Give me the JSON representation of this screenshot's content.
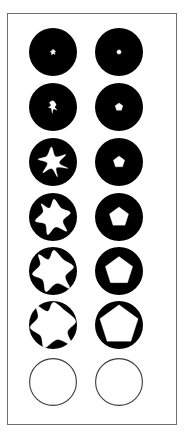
{
  "figure": {
    "title": "Shape growth series",
    "background_color": "#ffffff",
    "frame": {
      "border_color": "#6e6e72",
      "border_width_px": 1,
      "x": 7,
      "y": 13,
      "width": 170,
      "height": 412
    },
    "disk_color": "#000000",
    "inner_shape_color": "#ffffff",
    "empty_circle_stroke": "#3a3a3a",
    "rows": 7,
    "columns": 2,
    "column_labels": [
      "irregular",
      "regular"
    ],
    "circle_radius_px": 24
  },
  "chart_data": {
    "type": "diagram-grid",
    "title": "Shape growth series",
    "xlabel": "",
    "ylabel": "",
    "columns": [
      {
        "name": "irregular",
        "shape_family": "pinwheel-star"
      },
      {
        "name": "regular",
        "shape_family": "polygon"
      }
    ],
    "rows": [
      {
        "index": 1,
        "fraction": 0.04
      },
      {
        "index": 2,
        "fraction": 0.11
      },
      {
        "index": 3,
        "fraction": 0.24
      },
      {
        "index": 4,
        "fraction": 0.42
      },
      {
        "index": 5,
        "fraction": 0.62
      },
      {
        "index": 6,
        "fraction": 0.85
      },
      {
        "index": 7,
        "fraction": 1.0
      }
    ],
    "cells": [
      {
        "row": 1,
        "column": "irregular",
        "state": "disk-with-inner",
        "inner_scale": 0.11,
        "inner_points": "0,-1 0.34,-0.55 0.92,-0.28 0.52,0.2 0.78,0.82 0.1,0.56 -0.5,0.95 -0.42,0.3 -0.95,-0.12 -0.36,-0.42"
      },
      {
        "row": 1,
        "column": "regular",
        "state": "disk-with-inner",
        "inner_scale": 0.09,
        "inner_points": "0,-1 0.95,-0.31 0.59,0.81 -0.59,0.81 -0.95,-0.31"
      },
      {
        "row": 2,
        "column": "irregular",
        "state": "disk-with-inner",
        "inner_scale": 0.26,
        "inner_points": "0.02,-1 0.5,-0.38 0.28,0.02 0.62,0.5 0.06,0.35 -0.12,1 -0.3,0.22 -0.72,0.1 -0.34,-0.28 -0.55,-0.72"
      },
      {
        "row": 2,
        "column": "regular",
        "state": "disk-with-inner",
        "inner_scale": 0.17,
        "inner_points": "0,-1 0.95,-0.31 0.59,0.81 -0.59,0.81 -0.95,-0.31"
      },
      {
        "row": 3,
        "column": "irregular",
        "state": "disk-with-inner",
        "inner_scale": 0.62,
        "inner_points": "-0.1,-1 0.18,-0.36 0.86,-0.5 0.42,0.06 1,0.42 0.24,0.38 0.3,1 -0.1,0.44 -0.68,0.72 -0.38,0.08 -1,-0.18 -0.42,-0.4"
      },
      {
        "row": 3,
        "column": "regular",
        "state": "disk-with-inner",
        "inner_scale": 0.25,
        "inner_points": "0,-1 0.95,-0.31 0.59,0.81 -0.59,0.81 -0.95,-0.31"
      },
      {
        "row": 4,
        "column": "irregular",
        "state": "disk-with-inner",
        "inner_scale": 0.74,
        "inner_points": "0.06,-1 0.46,-0.5 0.98,-0.24 0.56,0.22 0.78,0.8 0.16,0.56 -0.3,1 -0.44,0.4 -1,0.22 -0.56,-0.28 -0.66,-0.74 -0.2,-0.5"
      },
      {
        "row": 4,
        "column": "regular",
        "state": "disk-with-inner",
        "inner_scale": 0.42,
        "inner_points": "0,-1 0.95,-0.31 0.59,0.81 -0.59,0.81 -0.95,-0.31"
      },
      {
        "row": 5,
        "column": "irregular",
        "state": "disk-with-inner",
        "inner_scale": 0.86,
        "inner_points": "0.04,-1 0.5,-0.56 1,-0.2 0.6,0.26 0.8,0.84 0.18,0.6 -0.34,1 -0.5,0.44 -1,0.16 -0.62,-0.3 -0.7,-0.8 -0.22,-0.56"
      },
      {
        "row": 5,
        "column": "regular",
        "state": "disk-with-inner",
        "inner_scale": 0.6,
        "inner_points": "0,-1 0.95,-0.31 0.59,0.81 -0.59,0.81 -0.95,-0.31"
      },
      {
        "row": 6,
        "column": "irregular",
        "state": "disk-with-inner",
        "inner_scale": 0.95,
        "inner_points": "0.02,-1 0.54,-0.62 1,-0.16 0.64,0.3 0.82,0.88 0.2,0.64 -0.38,1 -0.54,0.48 -1,0.12 -0.66,-0.34 -0.74,-0.86 -0.24,-0.6"
      },
      {
        "row": 6,
        "column": "regular",
        "state": "disk-with-inner",
        "inner_scale": 0.84,
        "inner_points": "0,-1 0.95,-0.31 0.59,0.81 -0.59,0.81 -0.95,-0.31"
      },
      {
        "row": 7,
        "column": "irregular",
        "state": "empty-outline",
        "inner_scale": 1.0,
        "inner_points": ""
      },
      {
        "row": 7,
        "column": "regular",
        "state": "empty-outline",
        "inner_scale": 1.0,
        "inner_points": ""
      }
    ]
  }
}
